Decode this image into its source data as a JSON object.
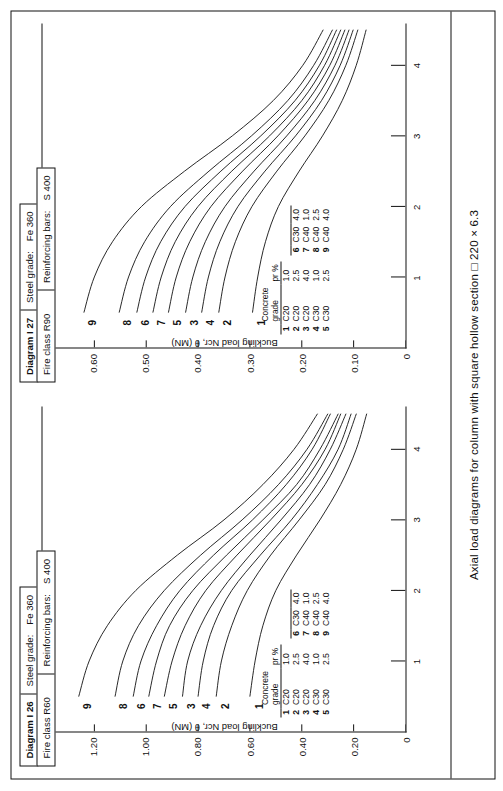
{
  "document": {
    "caption": "Axial load diagrams for column with square hollow section □ 220 × 6.3"
  },
  "panels": [
    {
      "header": {
        "diagram_label": "Diagram I 26",
        "fire_class_label": "Fire class R60",
        "steel_grade_label": "Steel grade:",
        "steel_grade_value": "Fe 360",
        "reinforcing_bars_label": "Reinforcing bars:",
        "reinforcing_bars_value": "S 400"
      },
      "axes": {
        "y_title": "Buckling load Nᴄʀ, θ (MN)",
        "y_title_plain": "Buckling load Ncr, θ (MN)",
        "y_ticks": [
          "1.40",
          "1.20",
          "1.00",
          "0.80",
          "0.60",
          "0.40",
          "0.20",
          "0"
        ],
        "x_title": "Buckling length Lᴄʀ, θ (m)",
        "x_ticks": [
          "1",
          "2",
          "3",
          "4"
        ]
      },
      "curve_labels": [
        "9",
        "8",
        "6",
        "7",
        "5",
        "3",
        "4",
        "2",
        "1"
      ],
      "legend": {
        "col_grade": "Concrete grade",
        "col_pr": "pʀ %",
        "col_pr_plain": "pr %",
        "rows_left": [
          {
            "idx": "1",
            "grade": "C20",
            "pr": "1.0"
          },
          {
            "idx": "2",
            "grade": "C20",
            "pr": "2.5"
          },
          {
            "idx": "3",
            "grade": "C20",
            "pr": "4.0"
          },
          {
            "idx": "4",
            "grade": "C30",
            "pr": "1.0"
          },
          {
            "idx": "5",
            "grade": "C30",
            "pr": "2.5"
          }
        ],
        "rows_right": [
          {
            "idx": "6",
            "grade": "C30",
            "pr": "4.0"
          },
          {
            "idx": "7",
            "grade": "C40",
            "pr": "1.0"
          },
          {
            "idx": "8",
            "grade": "C40",
            "pr": "2.5"
          },
          {
            "idx": "9",
            "grade": "C40",
            "pr": "4.0"
          }
        ]
      }
    },
    {
      "header": {
        "diagram_label": "Diagram I 27",
        "fire_class_label": "Fire class R90",
        "steel_grade_label": "Steel grade:",
        "steel_grade_value": "Fe 360",
        "reinforcing_bars_label": "Reinforcing bars:",
        "reinforcing_bars_value": "S 400"
      },
      "axes": {
        "y_title": "Buckling load Nᴄʀ, θ (MN)",
        "y_title_plain": "Buckling load Ncr, θ (MN)",
        "y_ticks": [
          "0.70",
          "0.60",
          "0.50",
          "0.40",
          "0.30",
          "0.20",
          "0.10",
          "0"
        ],
        "x_title": "Buckling length Lᴄʀ, θ (m)",
        "x_ticks": [
          "1",
          "2",
          "3",
          "4"
        ]
      },
      "curve_labels": [
        "9",
        "8",
        "6",
        "7",
        "5",
        "3",
        "4",
        "2",
        "1"
      ],
      "legend": {
        "col_grade": "Concrete grade",
        "col_pr": "pʀ %",
        "col_pr_plain": "pr %",
        "rows_left": [
          {
            "idx": "1",
            "grade": "C20",
            "pr": "1.0"
          },
          {
            "idx": "2",
            "grade": "C20",
            "pr": "2.5"
          },
          {
            "idx": "3",
            "grade": "C20",
            "pr": "4.0"
          },
          {
            "idx": "4",
            "grade": "C30",
            "pr": "1.0"
          },
          {
            "idx": "5",
            "grade": "C30",
            "pr": "2.5"
          }
        ],
        "rows_right": [
          {
            "idx": "6",
            "grade": "C30",
            "pr": "4.0"
          },
          {
            "idx": "7",
            "grade": "C40",
            "pr": "1.0"
          },
          {
            "idx": "8",
            "grade": "C40",
            "pr": "2.5"
          },
          {
            "idx": "9",
            "grade": "C40",
            "pr": "4.0"
          }
        ]
      }
    }
  ],
  "chart_data": [
    {
      "type": "line",
      "title": "Diagram I 26 — Fire class R60",
      "xlabel": "Buckling length Lcr, θ (m)",
      "ylabel": "Buckling load Ncr, θ (MN)",
      "xlim": [
        0,
        4.6
      ],
      "ylim": [
        0,
        1.4
      ],
      "xticks": [
        1,
        2,
        3,
        4
      ],
      "yticks": [
        0,
        0.2,
        0.4,
        0.6,
        0.8,
        1.0,
        1.2,
        1.4
      ],
      "grid": false,
      "legend_position": "inside-lower-left",
      "x": [
        0.5,
        1.0,
        1.5,
        2.0,
        2.5,
        3.0,
        3.5,
        4.0,
        4.5
      ],
      "series": [
        {
          "name": "1",
          "label": "C20 / pr 1.0 %",
          "values": [
            0.6,
            0.58,
            0.55,
            0.5,
            0.42,
            0.33,
            0.25,
            0.19,
            0.15
          ]
        },
        {
          "name": "2",
          "label": "C20 / pr 2.5 %",
          "values": [
            0.73,
            0.71,
            0.67,
            0.61,
            0.52,
            0.41,
            0.31,
            0.24,
            0.19
          ]
        },
        {
          "name": "3",
          "label": "C20 / pr 4.0 %",
          "values": [
            0.86,
            0.84,
            0.79,
            0.71,
            0.6,
            0.48,
            0.37,
            0.29,
            0.23
          ]
        },
        {
          "name": "4",
          "label": "C30 / pr 1.0 %",
          "values": [
            0.8,
            0.78,
            0.74,
            0.67,
            0.56,
            0.44,
            0.34,
            0.26,
            0.21
          ]
        },
        {
          "name": "5",
          "label": "C30 / pr 2.5 %",
          "values": [
            0.93,
            0.9,
            0.85,
            0.77,
            0.65,
            0.52,
            0.4,
            0.31,
            0.25
          ]
        },
        {
          "name": "6",
          "label": "C30 / pr 4.0 %",
          "values": [
            1.05,
            1.02,
            0.96,
            0.87,
            0.74,
            0.59,
            0.46,
            0.36,
            0.29
          ]
        },
        {
          "name": "7",
          "label": "C40 / pr 1.0 %",
          "values": [
            0.99,
            0.96,
            0.91,
            0.82,
            0.69,
            0.55,
            0.42,
            0.33,
            0.26
          ]
        },
        {
          "name": "8",
          "label": "C40 / pr 2.5 %",
          "values": [
            1.12,
            1.09,
            1.03,
            0.93,
            0.79,
            0.63,
            0.49,
            0.38,
            0.3
          ]
        },
        {
          "name": "9",
          "label": "C40 / pr 4.0 %",
          "values": [
            1.26,
            1.22,
            1.15,
            1.04,
            0.88,
            0.7,
            0.55,
            0.43,
            0.34
          ]
        }
      ]
    },
    {
      "type": "line",
      "title": "Diagram I 27 — Fire class R90",
      "xlabel": "Buckling length Lcr, θ (m)",
      "ylabel": "Buckling load Ncr, θ (MN)",
      "xlim": [
        0,
        4.6
      ],
      "ylim": [
        0,
        0.7
      ],
      "xticks": [
        1,
        2,
        3,
        4
      ],
      "yticks": [
        0,
        0.1,
        0.2,
        0.3,
        0.4,
        0.5,
        0.6,
        0.7
      ],
      "grid": false,
      "legend_position": "inside-lower-left",
      "x": [
        0.5,
        1.0,
        1.5,
        2.0,
        2.5,
        3.0,
        3.5,
        4.0,
        4.5
      ],
      "series": [
        {
          "name": "1",
          "label": "C20 / pr 1.0 %",
          "values": [
            0.295,
            0.285,
            0.27,
            0.245,
            0.205,
            0.16,
            0.122,
            0.095,
            0.076
          ]
        },
        {
          "name": "2",
          "label": "C20 / pr 2.5 %",
          "values": [
            0.36,
            0.348,
            0.328,
            0.296,
            0.248,
            0.194,
            0.148,
            0.115,
            0.092
          ]
        },
        {
          "name": "3",
          "label": "C20 / pr 4.0 %",
          "values": [
            0.424,
            0.41,
            0.386,
            0.348,
            0.292,
            0.229,
            0.175,
            0.136,
            0.109
          ]
        },
        {
          "name": "4",
          "label": "C30 / pr 1.0 %",
          "values": [
            0.393,
            0.38,
            0.358,
            0.323,
            0.271,
            0.212,
            0.162,
            0.126,
            0.101
          ]
        },
        {
          "name": "5",
          "label": "C30 / pr 2.5 %",
          "values": [
            0.457,
            0.442,
            0.416,
            0.375,
            0.314,
            0.246,
            0.188,
            0.146,
            0.117
          ]
        },
        {
          "name": "6",
          "label": "C30 / pr 4.0 %",
          "values": [
            0.518,
            0.501,
            0.472,
            0.425,
            0.356,
            0.279,
            0.213,
            0.166,
            0.133
          ]
        },
        {
          "name": "7",
          "label": "C40 / pr 1.0 %",
          "values": [
            0.487,
            0.471,
            0.444,
            0.4,
            0.335,
            0.262,
            0.2,
            0.156,
            0.125
          ]
        },
        {
          "name": "8",
          "label": "C40 / pr 2.5 %",
          "values": [
            0.552,
            0.534,
            0.503,
            0.453,
            0.379,
            0.297,
            0.227,
            0.177,
            0.141
          ]
        },
        {
          "name": "9",
          "label": "C40 / pr 4.0 %",
          "values": [
            0.62,
            0.6,
            0.565,
            0.509,
            0.426,
            0.334,
            0.255,
            0.198,
            0.159
          ]
        }
      ]
    }
  ]
}
